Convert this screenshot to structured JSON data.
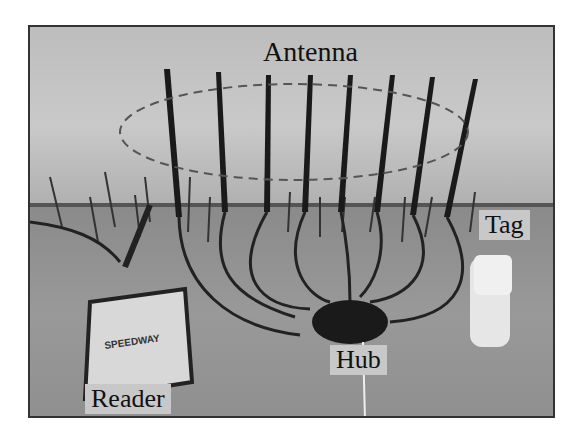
{
  "figure": {
    "labels": {
      "antenna": "Antenna",
      "tag": "Tag",
      "hub": "Hub",
      "reader": "Reader"
    },
    "reader_brand": "SPEEDWAY",
    "antenna_count": 8
  }
}
